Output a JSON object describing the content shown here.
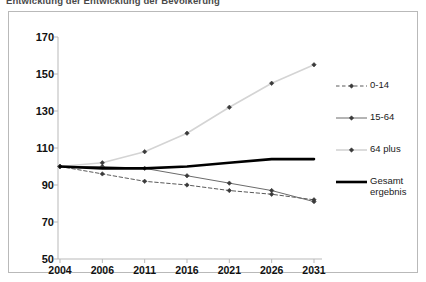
{
  "title": "Entwicklung der Entwicklung der Bevölkerung",
  "chart_data": {
    "type": "line",
    "title": "Entwicklung der Entwicklung der Bevölkerung",
    "xlabel": "",
    "ylabel": "",
    "categories": [
      "2004",
      "2006",
      "2011",
      "2016",
      "2021",
      "2026",
      "2031"
    ],
    "x": [
      2004,
      2006,
      2011,
      2016,
      2021,
      2026,
      2031
    ],
    "ylim": [
      50,
      170
    ],
    "yticks": [
      50,
      70,
      90,
      110,
      130,
      150,
      170
    ],
    "grid": false,
    "legend_position": "right",
    "series": [
      {
        "name": "0-14",
        "color": "#5a5a5a",
        "style": "dashed",
        "marker": "diamond",
        "width": 1,
        "values": [
          100,
          96,
          92,
          90,
          87,
          85,
          82
        ]
      },
      {
        "name": "15-64",
        "color": "#6b6b6b",
        "style": "solid",
        "marker": "diamond",
        "width": 1,
        "values": [
          100,
          100,
          99,
          95,
          91,
          87,
          81
        ]
      },
      {
        "name": "64 plus",
        "color": "#d4d4d4",
        "style": "solid",
        "marker": "diamond",
        "width": 1.6,
        "values": [
          100,
          102,
          108,
          118,
          132,
          145,
          155
        ]
      },
      {
        "name": "Gesamt\nergebnis",
        "color": "#000000",
        "style": "solid",
        "marker": "none",
        "width": 2.6,
        "values": [
          100,
          99,
          99,
          100,
          102,
          104,
          104
        ]
      }
    ]
  },
  "axes": {
    "y_ticks": [
      "170",
      "150",
      "130",
      "110",
      "90",
      "70",
      "50"
    ],
    "x_ticks": [
      "2004",
      "2006",
      "2011",
      "2016",
      "2021",
      "2026",
      "2031"
    ]
  },
  "legend": {
    "items": [
      {
        "label": "0-14",
        "key": "dashed-line-key"
      },
      {
        "label": "15-64",
        "key": "solid-gray-line-key"
      },
      {
        "label": "64 plus",
        "key": "light-gray-line-key"
      },
      {
        "label": "Gesamt\nergebnis",
        "key": "thick-black-line-key"
      }
    ]
  },
  "colors": {
    "axis": "#b9b9b9",
    "frame": "#b9b9b9",
    "series_0_14": "#5a5a5a",
    "series_15_64": "#6b6b6b",
    "series_64plus": "#d4d4d4",
    "series_gesamt": "#000000"
  }
}
